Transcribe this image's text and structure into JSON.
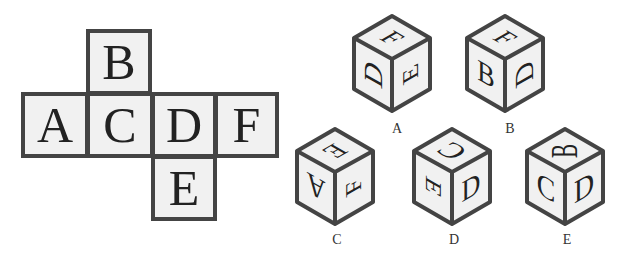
{
  "net": {
    "faces": [
      {
        "id": "B",
        "letter": "B",
        "x": 86,
        "y": 29,
        "w": 66,
        "h": 66
      },
      {
        "id": "A",
        "letter": "A",
        "x": 21,
        "y": 92,
        "w": 68,
        "h": 66
      },
      {
        "id": "C",
        "letter": "C",
        "x": 86,
        "y": 92,
        "w": 68,
        "h": 66
      },
      {
        "id": "D",
        "letter": "D",
        "x": 151,
        "y": 92,
        "w": 66,
        "h": 66
      },
      {
        "id": "F",
        "letter": "F",
        "x": 214,
        "y": 92,
        "w": 65,
        "h": 66
      },
      {
        "id": "E",
        "letter": "E",
        "x": 151,
        "y": 155,
        "w": 66,
        "h": 66
      }
    ]
  },
  "options": [
    {
      "label": "A",
      "top": "F",
      "left": "D",
      "right": "E",
      "label_x": 397,
      "label_y": 122
    },
    {
      "label": "B",
      "top": "F",
      "left": "B",
      "right": "D",
      "label_x": 510,
      "label_y": 122
    },
    {
      "label": "C",
      "top": "E",
      "left": "A",
      "right": "F",
      "label_x": 337,
      "label_y": 232
    },
    {
      "label": "D",
      "top": "C",
      "left": "E",
      "right": "D",
      "label_x": 454,
      "label_y": 232
    },
    {
      "label": "E",
      "top": "B",
      "left": "C",
      "right": "D",
      "label_x": 567,
      "label_y": 232
    }
  ],
  "colors": {
    "stroke": "#444444",
    "face_fill": "#f1f1f1",
    "text": "#222222"
  }
}
